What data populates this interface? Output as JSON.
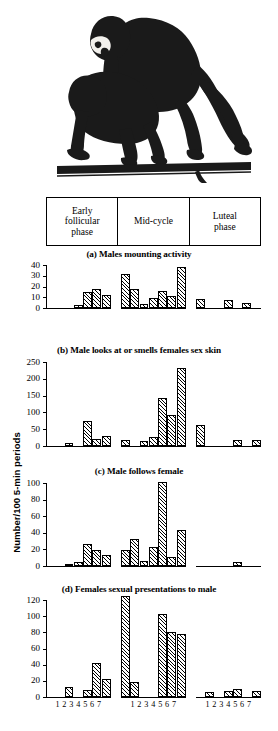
{
  "figure": {
    "illustration_alt": "line drawing of two monkeys mounting on a branch",
    "y_axis_title": "Number/100 5-min periods",
    "phase_header": {
      "cells": [
        "Early\nfollicular\nphase",
        "Mid-cycle",
        "Luteal\nphase"
      ],
      "cell_lines": [
        [
          "Early",
          "follicular",
          "phase"
        ],
        [
          "Mid-cycle"
        ],
        [
          "Luteal",
          "phase"
        ]
      ]
    },
    "x_tick_labels": [
      "1",
      "2",
      "3",
      "4",
      "5",
      "6",
      "7"
    ],
    "x_tick_row_text": "1 2 3 4 5 6 7"
  },
  "chart_data": [
    {
      "id": "a",
      "type": "bar",
      "title": "(a) Males mounting activity",
      "xlabel": "",
      "ylabel": "Number/100 5-min periods",
      "ylim": [
        0,
        40
      ],
      "yticks": [
        0,
        10,
        20,
        30,
        40
      ],
      "ytick_labels": [
        "0",
        "10",
        "20",
        "30",
        "40"
      ],
      "grid": false,
      "legend": "none",
      "categories": [
        "1",
        "2",
        "3",
        "4",
        "5",
        "6",
        "7"
      ],
      "groups": [
        "Early follicular phase",
        "Mid-cycle",
        "Luteal phase"
      ],
      "series": [
        {
          "name": "Early follicular phase",
          "values": [
            0,
            0,
            0,
            3,
            15,
            18,
            12
          ]
        },
        {
          "name": "Mid-cycle",
          "values": [
            32,
            18,
            4,
            9,
            15.5,
            11,
            38
          ]
        },
        {
          "name": "Luteal phase",
          "values": [
            8.5,
            0,
            0,
            7,
            0,
            4.5,
            0
          ]
        }
      ]
    },
    {
      "id": "b",
      "type": "bar",
      "title": "(b) Male looks at or smells females sex skin",
      "xlabel": "",
      "ylabel": "Number/100 5-min periods",
      "ylim": [
        0,
        250
      ],
      "yticks": [
        0,
        50,
        100,
        150,
        200,
        250
      ],
      "ytick_labels": [
        "0",
        "50",
        "100",
        "150",
        "200",
        "250"
      ],
      "grid": false,
      "legend": "none",
      "categories": [
        "1",
        "2",
        "3",
        "4",
        "5",
        "6",
        "7"
      ],
      "groups": [
        "Early follicular phase",
        "Mid-cycle",
        "Luteal phase"
      ],
      "series": [
        {
          "name": "Early follicular phase",
          "values": [
            0,
            0,
            8,
            0,
            75,
            22,
            30
          ]
        },
        {
          "name": "Mid-cycle",
          "values": [
            18,
            0,
            14,
            28,
            143,
            92,
            233
          ]
        },
        {
          "name": "Luteal phase",
          "values": [
            62,
            0,
            0,
            0,
            18,
            0,
            17
          ]
        }
      ]
    },
    {
      "id": "c",
      "type": "bar",
      "title": "(c) Male follows female",
      "xlabel": "",
      "ylabel": "Number/100 5-min periods",
      "ylim": [
        0,
        100
      ],
      "yticks": [
        0,
        20,
        40,
        60,
        80,
        100
      ],
      "ytick_labels": [
        "0",
        "20",
        "40",
        "60",
        "80",
        "100"
      ],
      "grid": false,
      "legend": "none",
      "categories": [
        "1",
        "2",
        "3",
        "4",
        "5",
        "6",
        "7"
      ],
      "groups": [
        "Early follicular phase",
        "Mid-cycle",
        "Luteal phase"
      ],
      "series": [
        {
          "name": "Early follicular phase",
          "values": [
            0,
            0,
            3,
            5,
            27,
            19,
            13
          ]
        },
        {
          "name": "Mid-cycle",
          "values": [
            19,
            33,
            6,
            23,
            101,
            11,
            43
          ]
        },
        {
          "name": "Luteal phase",
          "values": [
            0,
            0,
            0,
            0,
            5,
            0,
            0
          ]
        }
      ]
    },
    {
      "id": "d",
      "type": "bar",
      "title": "(d) Females sexual presentations to male",
      "xlabel": "",
      "ylabel": "Number/100 5-min periods",
      "ylim": [
        0,
        120
      ],
      "yticks": [
        0,
        20,
        40,
        60,
        80,
        100,
        120
      ],
      "ytick_labels": [
        "0",
        "20",
        "40",
        "60",
        "80",
        "100",
        "120"
      ],
      "grid": false,
      "legend": "none",
      "categories": [
        "1",
        "2",
        "3",
        "4",
        "5",
        "6",
        "7"
      ],
      "groups": [
        "Early follicular phase",
        "Mid-cycle",
        "Luteal phase"
      ],
      "series": [
        {
          "name": "Early follicular phase",
          "values": [
            0,
            0,
            12,
            0,
            9,
            42,
            22
          ]
        },
        {
          "name": "Mid-cycle",
          "values": [
            125,
            18,
            0,
            0,
            103,
            81,
            78
          ]
        },
        {
          "name": "Luteal phase",
          "values": [
            0,
            6,
            0,
            8,
            10,
            0,
            8
          ]
        }
      ]
    }
  ]
}
